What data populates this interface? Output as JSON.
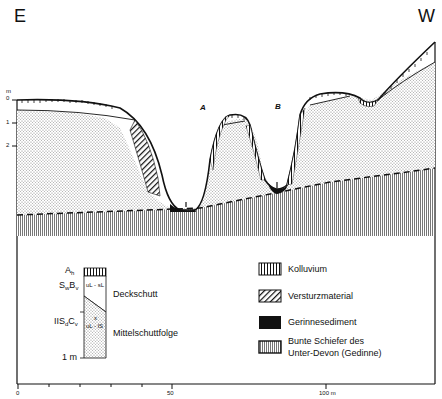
{
  "profile": {
    "left_direction": "E",
    "right_direction": "W",
    "valley_labels": [
      "A",
      "B"
    ],
    "depth_axis": {
      "unit": "m",
      "ticks": [
        "0",
        "1",
        "2"
      ]
    }
  },
  "soil_column": {
    "horizons": [
      {
        "label": "A",
        "sub": "h"
      },
      {
        "label": "S",
        "sub": "w",
        "label2": "B",
        "sub2": "v"
      },
      {
        "label": "IIS",
        "sub": "d",
        "label2": "C",
        "sub2": "v"
      }
    ],
    "textures": {
      "upper": "uL - sL",
      "lower_marker": "x",
      "lower": "uL - lS"
    },
    "units": {
      "upper": "Deckschutt",
      "lower": "Mittelschuttfolge"
    },
    "depth_label": "1 m"
  },
  "legend": {
    "items": [
      {
        "pattern": "vertical-stripes",
        "label": "Kolluvium"
      },
      {
        "pattern": "diagonal-hatch",
        "label": "Versturzmaterial"
      },
      {
        "pattern": "solid-black",
        "label": "Gerinnesediment"
      },
      {
        "pattern": "fine-vertical-gray",
        "label": "Bunte Schiefer des",
        "label2": "Unter-Devon (Gedinne)"
      }
    ]
  },
  "scale": {
    "labels": [
      "0",
      "50",
      "100 m"
    ]
  },
  "colors": {
    "ink": "#111111",
    "stipple": "#8a8a8a",
    "bedrock": "#7a7a7a",
    "background": "#ffffff"
  }
}
